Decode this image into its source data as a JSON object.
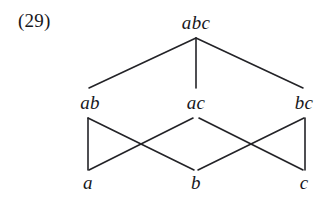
{
  "figure": {
    "number_label": "(29)",
    "label_position": {
      "x": 18,
      "y": 10
    },
    "type": "hasse-diagram",
    "background_color": "#ffffff",
    "line_color": "#232327",
    "text_color": "#17171b",
    "line_width": 1.6
  },
  "nodes": [
    {
      "id": "abc",
      "label": "abc",
      "x": 196,
      "y": 22,
      "level": 0
    },
    {
      "id": "ab",
      "label": "ab",
      "x": 90,
      "y": 102,
      "level": 1
    },
    {
      "id": "ac",
      "label": "ac",
      "x": 196,
      "y": 102,
      "level": 1
    },
    {
      "id": "bc",
      "label": "bc",
      "x": 304,
      "y": 102,
      "level": 1
    },
    {
      "id": "a",
      "label": "a",
      "x": 88,
      "y": 182,
      "level": 2
    },
    {
      "id": "b",
      "label": "b",
      "x": 196,
      "y": 182,
      "level": 2
    },
    {
      "id": "c",
      "label": "c",
      "x": 304,
      "y": 182,
      "level": 2
    }
  ],
  "edges": [
    {
      "id": "abc-ab",
      "from": "abc",
      "to": "ab",
      "x1": 196,
      "y1": 38,
      "x2": 89,
      "y2": 88
    },
    {
      "id": "abc-ac",
      "from": "abc",
      "to": "ac",
      "x1": 196,
      "y1": 38,
      "x2": 196,
      "y2": 88
    },
    {
      "id": "abc-bc",
      "from": "abc",
      "to": "bc",
      "x1": 196,
      "y1": 38,
      "x2": 303,
      "y2": 88
    },
    {
      "id": "ab-a",
      "from": "ab",
      "to": "a",
      "x1": 88,
      "y1": 118,
      "x2": 88,
      "y2": 170
    },
    {
      "id": "ab-b",
      "from": "ab",
      "to": "b",
      "x1": 88,
      "y1": 118,
      "x2": 194,
      "y2": 170
    },
    {
      "id": "ac-a",
      "from": "ac",
      "to": "a",
      "x1": 193,
      "y1": 118,
      "x2": 89,
      "y2": 170
    },
    {
      "id": "ac-b",
      "from": "ac",
      "to": "b",
      "x1": 199,
      "y1": 118,
      "x2": 303,
      "y2": 170
    },
    {
      "id": "bc-b",
      "from": "bc",
      "to": "b",
      "x1": 304,
      "y1": 118,
      "x2": 198,
      "y2": 170
    },
    {
      "id": "bc-c",
      "from": "bc",
      "to": "c",
      "x1": 305,
      "y1": 118,
      "x2": 305,
      "y2": 170
    }
  ]
}
